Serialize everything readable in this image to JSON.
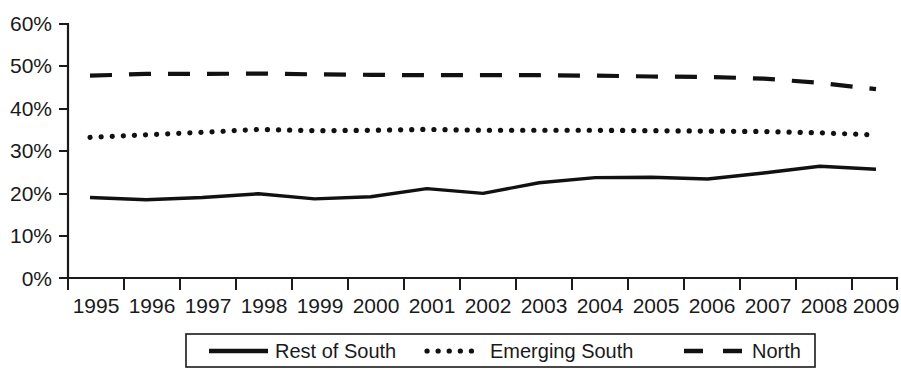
{
  "chart_data": {
    "type": "line",
    "title": "",
    "subtitle": "",
    "xlabel": "",
    "ylabel": "",
    "x": [
      1995,
      1996,
      1997,
      1998,
      1999,
      2000,
      2001,
      2002,
      2003,
      2004,
      2005,
      2006,
      2007,
      2008,
      2009
    ],
    "categories": [
      "1995",
      "1996",
      "1997",
      "1998",
      "1999",
      "2000",
      "2001",
      "2002",
      "2003",
      "2004",
      "2005",
      "2006",
      "2007",
      "2008",
      "2009"
    ],
    "series": [
      {
        "name": "Rest of South",
        "style": "solid",
        "values": [
          19.0,
          18.5,
          19.0,
          19.9,
          18.7,
          19.2,
          21.1,
          20.0,
          22.5,
          23.7,
          23.8,
          23.4,
          24.8,
          26.4,
          25.7
        ]
      },
      {
        "name": "Emerging South",
        "style": "dotted",
        "values": [
          33.2,
          33.8,
          34.4,
          35.1,
          34.8,
          34.9,
          35.1,
          34.9,
          34.9,
          34.9,
          34.8,
          34.7,
          34.6,
          34.3,
          33.8
        ]
      },
      {
        "name": "North",
        "style": "dashed",
        "values": [
          47.8,
          48.2,
          48.2,
          48.3,
          48.1,
          48.0,
          47.9,
          47.9,
          47.9,
          47.8,
          47.6,
          47.5,
          47.1,
          46.1,
          44.6
        ]
      }
    ],
    "ylim": [
      0,
      60
    ],
    "yticks": [
      0,
      10,
      20,
      30,
      40,
      50,
      60
    ],
    "ytick_labels": [
      "0%",
      "10%",
      "20%",
      "30%",
      "40%",
      "50%",
      "60%"
    ],
    "grid": false,
    "legend_position": "bottom",
    "legend_entries": [
      {
        "label": "Rest of South",
        "style": "solid"
      },
      {
        "label": "Emerging South",
        "style": "dotted"
      },
      {
        "label": "North",
        "style": "dashed"
      }
    ]
  },
  "axes": {
    "y_labels": [
      "60%",
      "50%",
      "40%",
      "30%",
      "20%",
      "10%",
      "0%"
    ],
    "x_labels": [
      "1995",
      "1996",
      "1997",
      "1998",
      "1999",
      "2000",
      "2001",
      "2002",
      "2003",
      "2004",
      "2005",
      "2006",
      "2007",
      "2008",
      "2009"
    ]
  },
  "legend": {
    "items": [
      {
        "label": "Rest of South"
      },
      {
        "label": "Emerging South"
      },
      {
        "label": "North"
      }
    ]
  }
}
